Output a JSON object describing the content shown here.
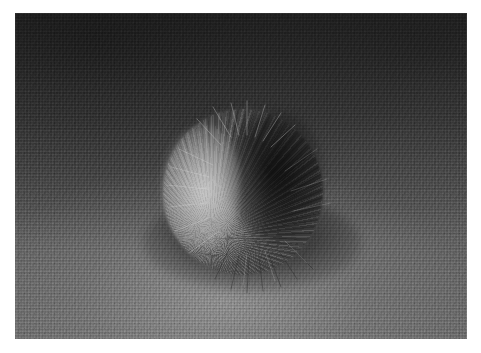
{
  "image": {
    "kind": "photograph",
    "title": "Grey fur pom-pom on dark woven fabric",
    "orientation": "landscape",
    "color_mode": "grayscale",
    "canvas": {
      "width": 481,
      "height": 353
    },
    "border": {
      "style": "white margin",
      "color": "#ffffff",
      "left": 15,
      "top": 13,
      "right": 14,
      "bottom": 14
    },
    "plate": {
      "x": 15,
      "y": 13,
      "width": 452,
      "height": 326
    }
  },
  "scene": {
    "subject": {
      "name": "fur-pom-pom",
      "description": "Round ball of soft grey fur with strands radiating outward",
      "center": {
        "x": 228,
        "y": 179
      },
      "bounds": {
        "x": 163,
        "y": 109,
        "width": 160,
        "height": 166
      },
      "highlight_side": "left",
      "shadow_side": "right",
      "pivot": {
        "x": 196,
        "y": 226
      }
    },
    "background": {
      "name": "woven-fabric-surface",
      "description": "Dark charcoal knit fabric with fine weave texture",
      "lighting": "darker at top, brighter toward lower-left"
    },
    "cast_shadow": {
      "name": "ball-cast-shadow",
      "center": {
        "x": 237,
        "y": 230
      },
      "width": 218,
      "height": 96
    }
  },
  "palette": {
    "border": "#ffffff",
    "fabric_dark": "#3d3d3d",
    "fabric_mid": "#585858",
    "fabric_light": "#6b6b6b",
    "fur_highlight": "#bdbdbd",
    "fur_mid": "#8a8a8a",
    "fur_shadow": "#1a1a1a",
    "cast_shadow": "#0d0d0d"
  }
}
